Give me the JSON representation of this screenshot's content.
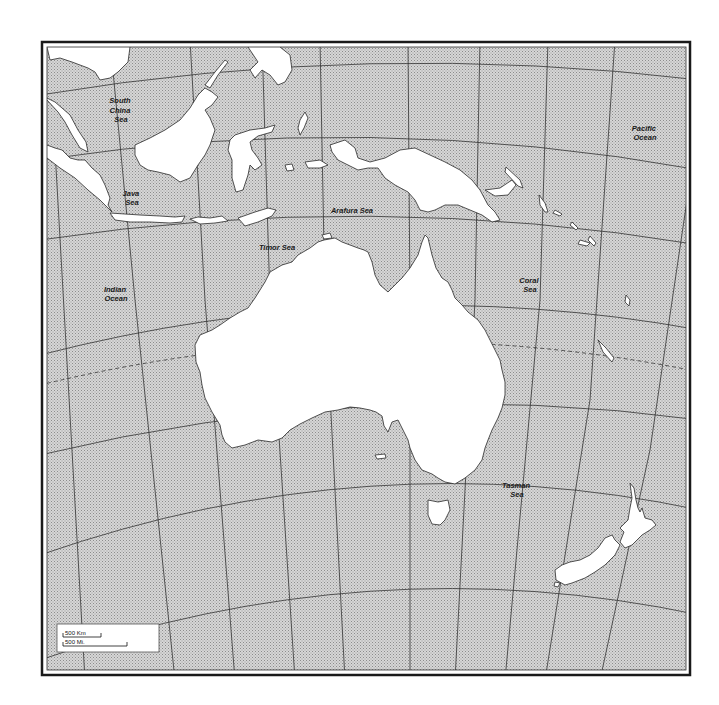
{
  "map": {
    "title": "Australia and Oceania outline map",
    "colors": {
      "ocean_pattern_light": "#d8d8d8",
      "ocean_pattern_dark": "#9a9a9a",
      "land": "#ffffff",
      "border": "#1a1a1a",
      "graticule": "#333333"
    },
    "labels": {
      "south_china_sea": [
        "South",
        "China",
        "Sea"
      ],
      "java_sea": [
        "Java",
        "Sea"
      ],
      "arafura_sea": "Arafura Sea",
      "timor_sea": "Timor Sea",
      "indian_ocean": [
        "Indian",
        "Ocean"
      ],
      "coral_sea": [
        "Coral",
        "Sea"
      ],
      "pacific_ocean": [
        "Pacific",
        "Ocean"
      ],
      "tasman_sea": [
        "Tasman",
        "Sea"
      ]
    },
    "scale_bar": {
      "km_label": "500 Km",
      "mi_label": "500 Mi."
    },
    "landmasses": [
      "Australia",
      "New Guinea",
      "Borneo",
      "Sumatra",
      "Java",
      "Sulawesi",
      "Tasmania",
      "New Zealand North Island",
      "New Zealand South Island",
      "Malay Peninsula",
      "Solomon Islands",
      "Lesser Sunda Islands",
      "Vanuatu",
      "New Caledonia"
    ]
  }
}
